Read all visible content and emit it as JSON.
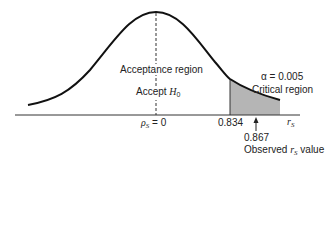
{
  "diagram": {
    "type": "one-tailed hypothesis test on a bell-shaped distribution",
    "center_label_prefix": "ρ",
    "center_label_sub": "S",
    "center_label_suffix": " = 0",
    "critical_value": "0.834",
    "observed_value": "0.867",
    "observed_label_prefix": "Observed ",
    "observed_label_var": "r",
    "observed_label_sub": "S",
    "observed_label_suffix": " value",
    "axis_label_var": "r",
    "axis_label_sub": "S",
    "acceptance_region_label": "Acceptance region",
    "accept_label_prefix": "Accept ",
    "accept_label_var": "H",
    "accept_label_sub": "0",
    "alpha_label": "α = 0.005",
    "critical_region_label": "Critical region",
    "colors": {
      "curve": "#111111",
      "shaded_region": "#b5b5b5",
      "axis": "#333333"
    }
  }
}
